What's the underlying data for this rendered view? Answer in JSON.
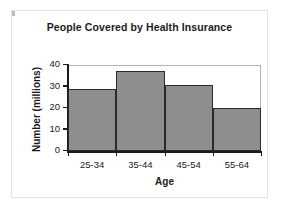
{
  "chart_data": {
    "type": "bar",
    "title": "People Covered by Health Insurance",
    "xlabel": "Age",
    "ylabel": "Number (millions)",
    "categories": [
      "25-34",
      "35-44",
      "45-54",
      "55-64"
    ],
    "values": [
      29,
      37,
      30.5,
      20
    ],
    "ylim": [
      0,
      40
    ],
    "yticks": [
      0,
      10,
      20,
      30,
      40
    ],
    "ytick_labels": [
      "0",
      "10",
      "20",
      "30",
      "40"
    ],
    "grid": false,
    "legend": null,
    "bar_style": "contiguous-histogram",
    "colors": {
      "bar_fill": "#8e8e8e",
      "bar_edge": "#2a2a2a",
      "axis": "#1a1a1a",
      "frame": "#b4b4b4",
      "background": "#ffffff",
      "card_border": "#e2e2e2",
      "text": "#1a1a1a"
    }
  }
}
